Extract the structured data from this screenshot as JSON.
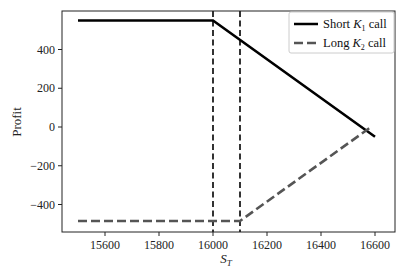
{
  "chart_data": {
    "type": "line",
    "title": "",
    "xlabel": "S_T",
    "xlabel_main": "S",
    "xlabel_sub": "T",
    "ylabel": "Profit",
    "xlim": [
      15450,
      16650
    ],
    "ylim": [
      -540,
      600
    ],
    "xticks": [
      15600,
      15800,
      16000,
      16200,
      16400,
      16600
    ],
    "yticks": [
      -400,
      -200,
      0,
      200,
      400
    ],
    "xtick_labels": [
      "15600",
      "15800",
      "16000",
      "16200",
      "16400",
      "16600"
    ],
    "ytick_labels": [
      "−400",
      "−200",
      "0",
      "200",
      "400"
    ],
    "grid": false,
    "legend_position": "upper right",
    "vlines": [
      {
        "x": 16000,
        "style": "dashed",
        "color": "#000000",
        "label": "K1"
      },
      {
        "x": 16100,
        "style": "dashed",
        "color": "#000000",
        "label": "K2"
      }
    ],
    "series": [
      {
        "name": "Short K1 call",
        "legend_main": "Short ",
        "legend_k": "K",
        "legend_sub": "1",
        "legend_tail": " call",
        "style": "solid",
        "color": "#000000",
        "x": [
          15500,
          16000,
          16600
        ],
        "y": [
          550,
          550,
          -50
        ]
      },
      {
        "name": "Long K2 call",
        "legend_main": "Long ",
        "legend_k": "K",
        "legend_sub": "2",
        "legend_tail": " call",
        "style": "dashed",
        "color": "#555555",
        "x": [
          15500,
          16100,
          16590
        ],
        "y": [
          -485,
          -485,
          5
        ]
      }
    ]
  }
}
